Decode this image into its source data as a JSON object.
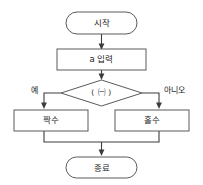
{
  "diagram": {
    "language": "Korean",
    "background_color": "#ffffff",
    "shape_stroke_color": "#5a5a5a",
    "line_color": "#3c3c3c",
    "text_color": "#222222",
    "nodes": {
      "start": {
        "label": "시작",
        "shape": "terminator"
      },
      "input": {
        "label": "a 입력",
        "shape": "process"
      },
      "decision": {
        "label": "( ㈠ )",
        "shape": "decision"
      },
      "even": {
        "label": "짝수",
        "shape": "process"
      },
      "odd": {
        "label": "홀수",
        "shape": "process"
      },
      "end": {
        "label": "종료",
        "shape": "terminator"
      }
    },
    "branches": {
      "yes": "예",
      "no": "아니오"
    }
  }
}
